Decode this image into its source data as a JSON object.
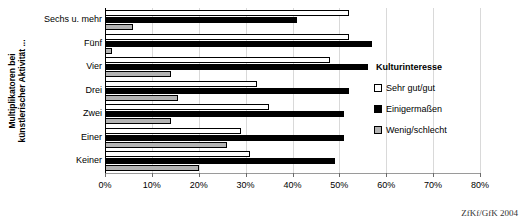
{
  "chart_data": {
    "type": "bar",
    "orientation": "horizontal",
    "title": "",
    "xlabel": "",
    "ylabel": "Multiplikatoren bei\nkünstlerischer Aktivität ...",
    "categories": [
      "Sechs u. mehr",
      "Fünf",
      "Vier",
      "Drei",
      "Zwei",
      "Einer",
      "Keiner"
    ],
    "series": [
      {
        "name": "Sehr gut/gut",
        "color": "#ffffff",
        "values": [
          52,
          52,
          48,
          32.5,
          35,
          29,
          31
        ]
      },
      {
        "name": "Einigermaßen",
        "color": "#000000",
        "values": [
          41,
          57,
          56,
          52,
          51,
          51,
          49
        ]
      },
      {
        "name": "Wenig/schlecht",
        "color": "#b3b3b3",
        "values": [
          6,
          1.5,
          14,
          15.5,
          14,
          26,
          20
        ]
      }
    ],
    "xlim": [
      0,
      80
    ],
    "xticks": [
      0,
      10,
      20,
      30,
      40,
      50,
      60,
      70,
      80
    ],
    "xtick_labels": [
      "0%",
      "10%",
      "20%",
      "30%",
      "40%",
      "50%",
      "60%",
      "70%",
      "80%"
    ],
    "grid": true,
    "legend_position": "right",
    "legend_title": "Kulturinteresse"
  },
  "legend": {
    "title": "Kulturinteresse",
    "entries": [
      {
        "label": "Sehr gut/gut",
        "swatch": "white"
      },
      {
        "label": "Einigermaßen",
        "swatch": "black"
      },
      {
        "label": "Wenig/schlecht",
        "swatch": "gray"
      }
    ]
  },
  "source": {
    "text": "ZfKf/GfK 2004"
  }
}
